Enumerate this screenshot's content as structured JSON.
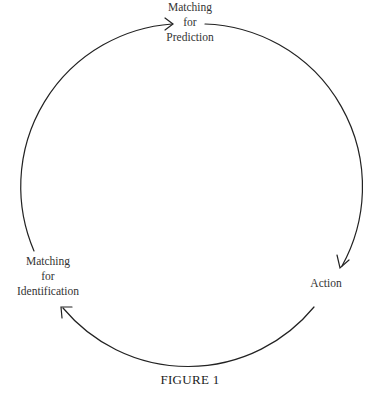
{
  "diagram": {
    "type": "cycle",
    "nodes": [
      {
        "id": "prediction",
        "lines": [
          "Matching",
          "for",
          "Prediction"
        ]
      },
      {
        "id": "action",
        "lines": [
          "Action"
        ]
      },
      {
        "id": "identification",
        "lines": [
          "Matching",
          "for",
          "Identification"
        ]
      }
    ],
    "edges": [
      {
        "from": "prediction",
        "to": "action",
        "direction": "clockwise"
      },
      {
        "from": "action",
        "to": "identification",
        "direction": "clockwise"
      },
      {
        "from": "identification",
        "to": "prediction",
        "direction": "clockwise"
      }
    ],
    "stroke_color": "#222222"
  },
  "labels": {
    "prediction": {
      "line1": "Matching",
      "line2": "for",
      "line3": "Prediction"
    },
    "identification": {
      "line1": "Matching",
      "line2": "for",
      "line3": "Identification"
    },
    "action": {
      "line1": "Action"
    }
  },
  "caption": "FIGURE 1"
}
